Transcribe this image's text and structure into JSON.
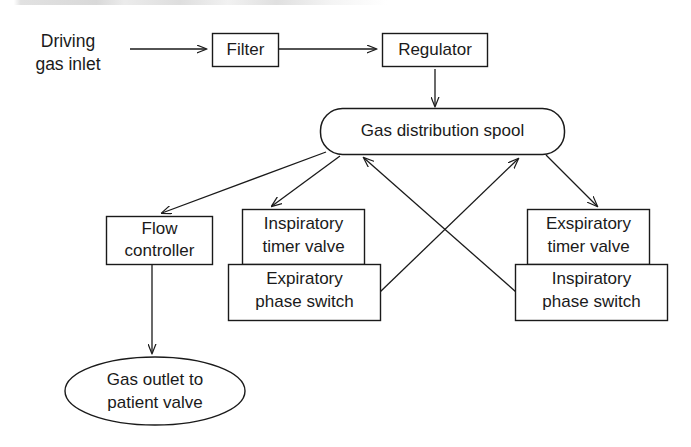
{
  "diagram": {
    "stroke_color": "#1a1a1a",
    "background_color": "#ffffff",
    "nodes": [
      {
        "id": "driving-gas-inlet",
        "shape": "text",
        "lines": [
          "Driving",
          "gas inlet"
        ]
      },
      {
        "id": "filter",
        "shape": "rect",
        "lines": [
          "Filter"
        ]
      },
      {
        "id": "regulator",
        "shape": "rect",
        "lines": [
          "Regulator"
        ]
      },
      {
        "id": "gas-distribution-spool",
        "shape": "rounded-rect",
        "lines": [
          "Gas distribution spool"
        ]
      },
      {
        "id": "flow-controller",
        "shape": "rect",
        "lines": [
          "Flow",
          "controller"
        ]
      },
      {
        "id": "inspiratory-timer-valve",
        "shape": "rect",
        "lines": [
          "Inspiratory",
          "timer valve"
        ]
      },
      {
        "id": "expiratory-phase-switch",
        "shape": "rect",
        "lines": [
          "Expiratory",
          "phase switch"
        ]
      },
      {
        "id": "exspiratory-timer-valve",
        "shape": "rect",
        "lines": [
          "Exspiratory",
          "timer valve"
        ]
      },
      {
        "id": "inspiratory-phase-switch",
        "shape": "rect",
        "lines": [
          "Inspiratory",
          "phase switch"
        ]
      },
      {
        "id": "gas-outlet-to-patient-valve",
        "shape": "ellipse",
        "lines": [
          "Gas outlet to",
          "patient valve"
        ]
      }
    ],
    "edges": [
      {
        "id": "inlet-to-filter",
        "from": "driving-gas-inlet",
        "to": "filter",
        "arrow": true
      },
      {
        "id": "filter-to-regulator",
        "from": "filter",
        "to": "regulator",
        "arrow": true
      },
      {
        "id": "regulator-to-spool",
        "from": "regulator",
        "to": "gas-distribution-spool",
        "arrow": true
      },
      {
        "id": "spool-to-flow-controller",
        "from": "gas-distribution-spool",
        "to": "flow-controller",
        "arrow": true
      },
      {
        "id": "spool-to-inspiratory-timer-valve",
        "from": "gas-distribution-spool",
        "to": "inspiratory-timer-valve",
        "arrow": true
      },
      {
        "id": "spool-to-exspiratory-timer-valve",
        "from": "gas-distribution-spool",
        "to": "exspiratory-timer-valve",
        "arrow": true
      },
      {
        "id": "expiratory-phase-switch-to-spool",
        "from": "expiratory-phase-switch",
        "to": "gas-distribution-spool",
        "arrow": true
      },
      {
        "id": "inspiratory-phase-switch-to-spool",
        "from": "inspiratory-phase-switch",
        "to": "gas-distribution-spool",
        "arrow": true
      },
      {
        "id": "flow-controller-to-gas-outlet",
        "from": "flow-controller",
        "to": "gas-outlet-to-patient-valve",
        "arrow": true
      }
    ]
  },
  "labels": {
    "driving_line1": "Driving",
    "driving_line2": "gas inlet",
    "filter": "Filter",
    "regulator": "Regulator",
    "spool": "Gas distribution spool",
    "flow_line1": "Flow",
    "flow_line2": "controller",
    "insp_timer_line1": "Inspiratory",
    "insp_timer_line2": "timer valve",
    "exp_switch_line1": "Expiratory",
    "exp_switch_line2": "phase switch",
    "exsp_timer_line1": "Exspiratory",
    "exsp_timer_line2": "timer valve",
    "insp_switch_line1": "Inspiratory",
    "insp_switch_line2": "phase switch",
    "outlet_line1": "Gas outlet to",
    "outlet_line2": "patient valve"
  }
}
